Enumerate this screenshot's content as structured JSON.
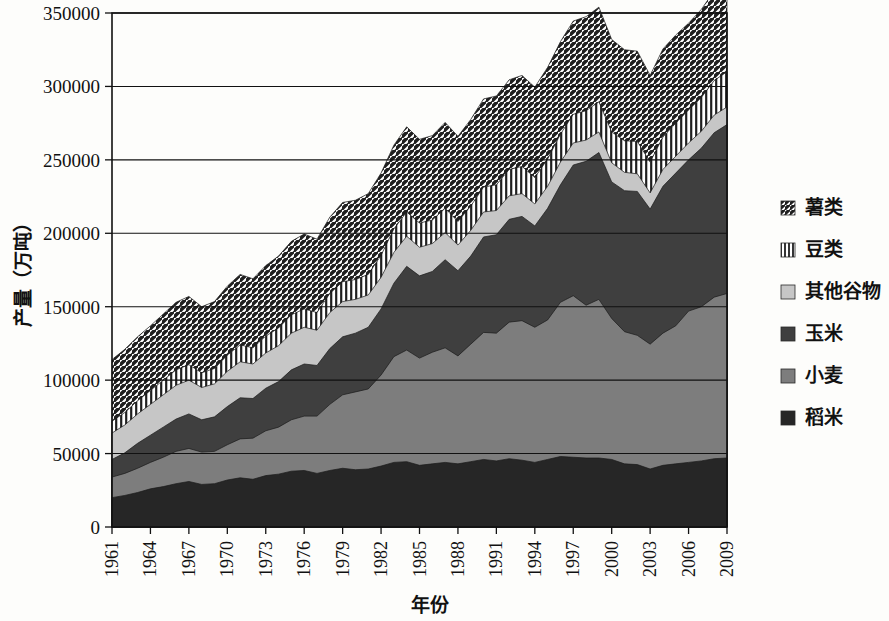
{
  "chart_data": {
    "type": "area",
    "stacked": true,
    "title": "",
    "xlabel": "年份",
    "ylabel": "产量（万吨）",
    "ylim": [
      0,
      350000
    ],
    "ytick_values": [
      0,
      50000,
      100000,
      150000,
      200000,
      250000,
      300000,
      350000
    ],
    "ytick_labels": [
      "0",
      "50000",
      "100000",
      "150000",
      "200000",
      "250000",
      "300000",
      "350000"
    ],
    "grid": true,
    "xlim": [
      1961,
      2009
    ],
    "x": [
      1961,
      1962,
      1963,
      1964,
      1965,
      1966,
      1967,
      1968,
      1969,
      1970,
      1971,
      1972,
      1973,
      1974,
      1975,
      1976,
      1977,
      1978,
      1979,
      1980,
      1981,
      1982,
      1983,
      1984,
      1985,
      1986,
      1987,
      1988,
      1989,
      1990,
      1991,
      1992,
      1993,
      1994,
      1995,
      1996,
      1997,
      1998,
      1999,
      2000,
      2001,
      2002,
      2003,
      2004,
      2005,
      2006,
      2007,
      2008,
      2009
    ],
    "xtick_labels": [
      "1961",
      "1964",
      "1967",
      "1970",
      "1973",
      "1976",
      "1979",
      "1982",
      "1985",
      "1988",
      "1991",
      "1994",
      "1997",
      "2000",
      "2003",
      "2006",
      "2009"
    ],
    "xtick_years": [
      1961,
      1964,
      1967,
      1970,
      1973,
      1976,
      1979,
      1982,
      1985,
      1988,
      1991,
      1994,
      1997,
      2000,
      2003,
      2006,
      2009
    ],
    "legend_position": "right",
    "series": [
      {
        "name": "稻米",
        "color": "#262626",
        "pattern": "solid",
        "values": [
          20000,
          21500,
          23500,
          26000,
          27500,
          29500,
          31000,
          29000,
          29500,
          32000,
          33500,
          32500,
          35000,
          36000,
          38000,
          38500,
          36500,
          38500,
          40000,
          39000,
          39500,
          41500,
          44000,
          44500,
          42000,
          43000,
          44000,
          43000,
          44500,
          46000,
          45000,
          46500,
          45500,
          44000,
          46000,
          48000,
          47500,
          47000,
          47000,
          46000,
          43000,
          42500,
          39500,
          42000,
          43000,
          44000,
          45000,
          46500,
          47000
        ]
      },
      {
        "name": "小麦",
        "color": "#7d7d7d",
        "pattern": "solid",
        "values": [
          14000,
          15000,
          16500,
          18000,
          20000,
          22000,
          22500,
          22000,
          22000,
          24000,
          26500,
          28000,
          30500,
          32000,
          35000,
          37000,
          39000,
          45000,
          50000,
          53000,
          54500,
          62000,
          72000,
          76000,
          73000,
          76000,
          78000,
          73500,
          80000,
          86500,
          87000,
          93000,
          95000,
          92000,
          95000,
          105000,
          110000,
          104000,
          108000,
          96000,
          90000,
          88000,
          85000,
          90000,
          94000,
          103000,
          105000,
          110000,
          112000
        ]
      },
      {
        "name": "玉米",
        "color": "#3f3f3f",
        "pattern": "solid",
        "values": [
          12000,
          14000,
          17000,
          18500,
          20500,
          22000,
          23500,
          22000,
          23500,
          26000,
          28000,
          27000,
          29000,
          31000,
          34000,
          35500,
          34500,
          38000,
          39500,
          40000,
          42000,
          45000,
          50000,
          57000,
          56000,
          55000,
          60000,
          58000,
          60000,
          65000,
          67000,
          70000,
          71000,
          69000,
          76000,
          80000,
          89000,
          98000,
          100000,
          93000,
          96000,
          98000,
          92000,
          100000,
          104000,
          103000,
          108000,
          112000,
          115000
        ]
      },
      {
        "name": "其他谷物",
        "color": "#c6c6c6",
        "pattern": "solid",
        "values": [
          18000,
          19000,
          20000,
          21000,
          22000,
          23000,
          23000,
          22000,
          22500,
          24000,
          24500,
          23500,
          24000,
          24500,
          25000,
          25000,
          24000,
          24500,
          24000,
          23000,
          22000,
          21500,
          21000,
          20500,
          19500,
          19000,
          18500,
          17500,
          17500,
          17000,
          16500,
          16000,
          15500,
          15000,
          15000,
          15500,
          15000,
          14500,
          14000,
          13000,
          12500,
          12000,
          11000,
          11500,
          11500,
          11500,
          11500,
          12000,
          12000
        ]
      },
      {
        "name": "豆类",
        "color": "#1f1f1f",
        "pattern": "vertical",
        "values": [
          8000,
          8500,
          9000,
          9500,
          10000,
          10500,
          10500,
          10000,
          10500,
          11000,
          11500,
          11000,
          11500,
          12000,
          12500,
          12500,
          12000,
          13000,
          13500,
          13500,
          14000,
          15000,
          16000,
          16500,
          16500,
          16000,
          16500,
          16000,
          16500,
          17000,
          17500,
          18000,
          18500,
          18000,
          18500,
          19000,
          19500,
          20000,
          20500,
          21000,
          21500,
          22000,
          21000,
          22000,
          22500,
          22500,
          23000,
          23500,
          24000
        ]
      },
      {
        "name": "薯类",
        "color": "#1f1f1f",
        "pattern": "diagonal",
        "values": [
          42000,
          43000,
          43500,
          44000,
          45000,
          46000,
          46500,
          45000,
          45500,
          47000,
          48000,
          47000,
          48000,
          49000,
          50000,
          51000,
          50000,
          52000,
          54000,
          54000,
          55000,
          56000,
          57000,
          58000,
          57000,
          57500,
          58500,
          58000,
          59000,
          60000,
          60500,
          61000,
          62000,
          61500,
          62500,
          63000,
          63500,
          64000,
          64500,
          63000,
          62000,
          61500,
          59000,
          60000,
          60000,
          59000,
          60000,
          61000,
          62000
        ]
      }
    ]
  },
  "legend": {
    "items": [
      {
        "label": "薯类",
        "swatch": "diagonal"
      },
      {
        "label": "豆类",
        "swatch": "vertical"
      },
      {
        "label": "其他谷物",
        "swatch": "light-gray"
      },
      {
        "label": "玉米",
        "swatch": "dark-gray"
      },
      {
        "label": "小麦",
        "swatch": "medium-gray"
      },
      {
        "label": "稻米",
        "swatch": "darkest"
      }
    ]
  }
}
